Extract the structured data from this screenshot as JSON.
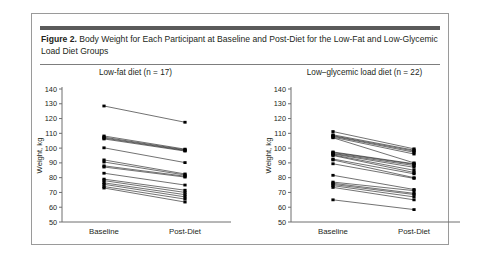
{
  "figure": {
    "label": "Figure 2.",
    "caption": " Body Weight for Each Participant at Baseline and Post-Diet for the Low-Fat and Low-Glycemic Load Diet Groups",
    "accent_color": "#5b5b5b",
    "border_color": "#9a9a9a",
    "series_color": "#1a1a1a"
  },
  "chart_data": [
    {
      "type": "line",
      "title": "Low-fat diet (n = 17)",
      "xlabel": "",
      "ylabel": "Weight, kg",
      "categories": [
        "Baseline",
        "Post-Diet"
      ],
      "x": [
        "Baseline",
        "Post-Diet"
      ],
      "ylim": [
        50,
        140
      ],
      "yticks": [
        50,
        60,
        70,
        80,
        90,
        100,
        110,
        120,
        130,
        140
      ],
      "grid": false,
      "legend": "none",
      "n": 17,
      "series": [
        {
          "name": "P1",
          "values": [
            128.5,
            117.5
          ]
        },
        {
          "name": "P2",
          "values": [
            108.2,
            99.3
          ]
        },
        {
          "name": "P3",
          "values": [
            107.4,
            98.8
          ]
        },
        {
          "name": "P4",
          "values": [
            106.8,
            98.4
          ]
        },
        {
          "name": "P5",
          "values": [
            106.2,
            98.0
          ]
        },
        {
          "name": "P6",
          "values": [
            100.2,
            90.2
          ]
        },
        {
          "name": "P7",
          "values": [
            92.0,
            82.5
          ]
        },
        {
          "name": "P8",
          "values": [
            90.6,
            81.8
          ]
        },
        {
          "name": "P9",
          "values": [
            88.0,
            81.0
          ]
        },
        {
          "name": "P10",
          "values": [
            87.2,
            80.4
          ]
        },
        {
          "name": "P11",
          "values": [
            83.0,
            75.0
          ]
        },
        {
          "name": "P12",
          "values": [
            79.0,
            71.5
          ]
        },
        {
          "name": "P13",
          "values": [
            78.0,
            70.0
          ]
        },
        {
          "name": "P14",
          "values": [
            76.5,
            68.5
          ]
        },
        {
          "name": "P15",
          "values": [
            75.5,
            67.0
          ]
        },
        {
          "name": "P16",
          "values": [
            74.0,
            65.5
          ]
        },
        {
          "name": "P17",
          "values": [
            73.0,
            63.5
          ]
        }
      ]
    },
    {
      "type": "line",
      "title": "Low–glycemic load diet (n = 22)",
      "xlabel": "",
      "ylabel": "Weight, kg",
      "categories": [
        "Baseline",
        "Post-Diet"
      ],
      "x": [
        "Baseline",
        "Post-Diet"
      ],
      "ylim": [
        50,
        140
      ],
      "yticks": [
        50,
        60,
        70,
        80,
        90,
        100,
        110,
        120,
        130,
        140
      ],
      "grid": false,
      "legend": "none",
      "n": 22,
      "series": [
        {
          "name": "G1",
          "values": [
            111.2,
            99.5
          ]
        },
        {
          "name": "G2",
          "values": [
            109.0,
            98.6
          ]
        },
        {
          "name": "G3",
          "values": [
            108.4,
            98.0
          ]
        },
        {
          "name": "G4",
          "values": [
            108.0,
            97.2
          ]
        },
        {
          "name": "G5",
          "values": [
            107.4,
            96.0
          ]
        },
        {
          "name": "G6",
          "values": [
            107.0,
            90.0
          ]
        },
        {
          "name": "G7",
          "values": [
            97.4,
            89.4
          ]
        },
        {
          "name": "G8",
          "values": [
            97.0,
            89.0
          ]
        },
        {
          "name": "G9",
          "values": [
            96.4,
            88.2
          ]
        },
        {
          "name": "G10",
          "values": [
            96.0,
            87.0
          ]
        },
        {
          "name": "G11",
          "values": [
            95.4,
            85.0
          ]
        },
        {
          "name": "G12",
          "values": [
            95.0,
            83.5
          ]
        },
        {
          "name": "G13",
          "values": [
            92.6,
            82.6
          ]
        },
        {
          "name": "G14",
          "values": [
            92.0,
            80.0
          ]
        },
        {
          "name": "G15",
          "values": [
            89.4,
            79.5
          ]
        },
        {
          "name": "G16",
          "values": [
            81.6,
            72.0
          ]
        },
        {
          "name": "G17",
          "values": [
            77.0,
            71.2
          ]
        },
        {
          "name": "G18",
          "values": [
            76.2,
            69.4
          ]
        },
        {
          "name": "G19",
          "values": [
            75.4,
            68.6
          ]
        },
        {
          "name": "G20",
          "values": [
            74.6,
            67.0
          ]
        },
        {
          "name": "G21",
          "values": [
            73.4,
            65.0
          ]
        },
        {
          "name": "G22",
          "values": [
            65.0,
            58.4
          ]
        }
      ]
    }
  ]
}
